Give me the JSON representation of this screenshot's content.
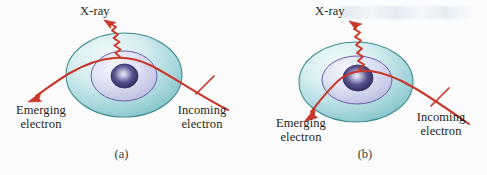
{
  "figure": {
    "type": "physics-diagram",
    "background_color": "#fcfcfc",
    "panels": [
      {
        "id": "a",
        "caption": "(a)",
        "labels": {
          "xray": "X-ray",
          "emerging_line1": "Emerging",
          "emerging_line2": "electron",
          "incoming_line1": "Incoming",
          "incoming_line2": "electron"
        },
        "description": "Incoming electron passes far from the nucleus, is deflected slightly, and emits a low-energy X-ray"
      },
      {
        "id": "b",
        "caption": "(b)",
        "labels": {
          "xray": "X-ray",
          "emerging_line1": "Emerging",
          "emerging_line2": "electron",
          "incoming_line1": "Incoming",
          "incoming_line2": "electron"
        },
        "description": "Incoming electron passes close to the nucleus, is deflected strongly, and emits a high-energy X-ray"
      }
    ],
    "colors": {
      "electron_path": "#c8382a",
      "xray_wave": "#c8382a",
      "outer_shell_stroke": "#3e8f91",
      "outer_shell_fill_light": "#e3f1f3",
      "outer_shell_fill_dark": "#8cc7cd",
      "middle_shell_stroke": "#6b5fa8",
      "middle_shell_fill_light": "#eef0f9",
      "middle_shell_fill_dark": "#b9bde0",
      "nucleus_stroke": "#3a3170",
      "nucleus_core": "#cfd3ea",
      "nucleus_edge": "#2f2a5e",
      "text": "#231f20"
    }
  }
}
